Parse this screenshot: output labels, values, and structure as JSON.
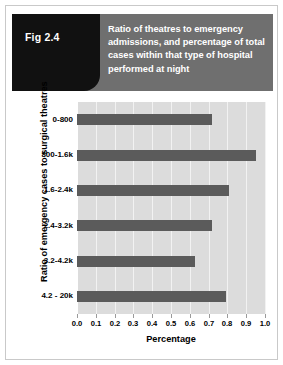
{
  "figure": {
    "tag": "Fig 2.4",
    "title": "Ratio of theatres to emergency admissions, and percentage of total cases within that type of hospital performed at night"
  },
  "colors": {
    "header_band": "#6f6f6f",
    "tag_box": "#111111",
    "plot_background": "#dcdcdc",
    "bar": "#5b5b5b",
    "gridline": "#f2f2f2"
  },
  "chart_data": {
    "type": "bar",
    "orientation": "horizontal",
    "title": "Ratio of theatres to emergency admissions, and percentage of total cases within that type of hospital performed at night",
    "xlabel": "Percentage",
    "ylabel": "Ratio of emergency cases to surgical theatres",
    "categories": [
      "0-800",
      "800-1.6k",
      "1.6-2.4k",
      "2.4-3.2k",
      "3.2-4.2k",
      "4.2 - 20k"
    ],
    "values": [
      0.72,
      0.95,
      0.81,
      0.72,
      0.63,
      0.79
    ],
    "xlim": [
      0.0,
      1.0
    ],
    "xticks": [
      0.0,
      0.1,
      0.2,
      0.3,
      0.4,
      0.5,
      0.6,
      0.7,
      0.8,
      0.9,
      1.0
    ],
    "xtick_labels": [
      "0.0",
      "0.1",
      "0.2",
      "0.3",
      "0.4",
      "0.5",
      "0.6",
      "0.7",
      "0.8",
      "0.9",
      "1.0"
    ],
    "grid": true,
    "grid_axis": "x",
    "legend": false
  }
}
